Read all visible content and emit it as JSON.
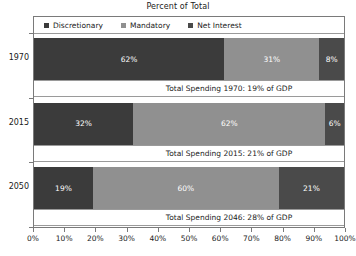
{
  "chart_data": {
    "type": "bar",
    "orientation": "horizontal",
    "stacked": true,
    "title": "Percent of Total",
    "xlabel": "",
    "ylabel": "",
    "xlim": [
      0,
      100
    ],
    "grid": false,
    "legend_position": "top-left inside plot",
    "categories": [
      "1970",
      "2015",
      "2050"
    ],
    "series": [
      {
        "name": "Discretionary",
        "color": "#3b3b3b",
        "values": [
          62,
          32,
          19
        ]
      },
      {
        "name": "Mandatory",
        "color": "#909090",
        "values": [
          31,
          62,
          60
        ]
      },
      {
        "name": "Net Interest",
        "color": "#4a4a4a",
        "values": [
          8,
          6,
          21
        ]
      }
    ],
    "value_labels": [
      [
        "62%",
        "31%",
        "8%"
      ],
      [
        "32%",
        "62%",
        "6%"
      ],
      [
        "19%",
        "60%",
        "21%"
      ]
    ],
    "annotations": [
      "Total Spending 1970: 19% of GDP",
      "Total Spending 2015: 21% of GDP",
      "Total Spending 2046: 28% of GDP"
    ],
    "xticks": [
      "0%",
      "10%",
      "20%",
      "30%",
      "40%",
      "50%",
      "60%",
      "70%",
      "80%",
      "90%",
      "100%"
    ],
    "xtick_values": [
      0,
      10,
      20,
      30,
      40,
      50,
      60,
      70,
      80,
      90,
      100
    ]
  },
  "legend": {
    "items": [
      {
        "label": "Discretionary"
      },
      {
        "label": "Mandatory"
      },
      {
        "label": "Net Interest"
      }
    ]
  },
  "axis": {
    "y_categories": [
      "1970",
      "2015",
      "2050"
    ],
    "x_labels": [
      "0%",
      "10%",
      "20%",
      "30%",
      "40%",
      "50%",
      "60%",
      "70%",
      "80%",
      "90%",
      "100%"
    ]
  },
  "rows": [
    {
      "category": "1970",
      "segments": [
        {
          "series": "Discretionary",
          "value": 62,
          "label": "62%"
        },
        {
          "series": "Mandatory",
          "value": 31,
          "label": "31%"
        },
        {
          "series": "Net Interest",
          "value": 8,
          "label": "8%"
        }
      ],
      "annotation": "Total Spending 1970: 19% of GDP"
    },
    {
      "category": "2015",
      "segments": [
        {
          "series": "Discretionary",
          "value": 32,
          "label": "32%"
        },
        {
          "series": "Mandatory",
          "value": 62,
          "label": "62%"
        },
        {
          "series": "Net Interest",
          "value": 6,
          "label": "6%"
        }
      ],
      "annotation": "Total Spending 2015: 21% of GDP"
    },
    {
      "category": "2050",
      "segments": [
        {
          "series": "Discretionary",
          "value": 19,
          "label": "19%"
        },
        {
          "series": "Mandatory",
          "value": 60,
          "label": "60%"
        },
        {
          "series": "Net Interest",
          "value": 21,
          "label": "21%"
        }
      ],
      "annotation": "Total Spending 2046: 28% of GDP"
    }
  ],
  "colors": {
    "discretionary": "#3b3b3b",
    "mandatory": "#909090",
    "net_interest": "#4a4a4a",
    "axis": "#7a7a7a",
    "background": "#ffffff",
    "text": "#1a1a1a",
    "value_text": "#ffffff"
  }
}
